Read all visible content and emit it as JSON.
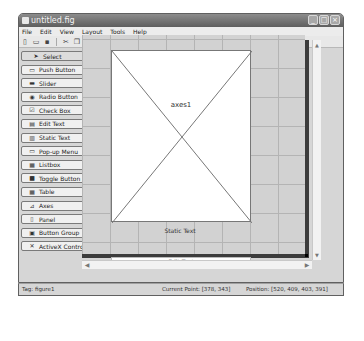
{
  "window": {
    "title": "untitled.fig",
    "controls": [
      "minimize",
      "maximize",
      "close"
    ]
  },
  "menubar": {
    "items": [
      "File",
      "Edit",
      "View",
      "Layout",
      "Tools",
      "Help"
    ]
  },
  "toolbar": {
    "icons": [
      "new-file-icon",
      "open-file-icon",
      "save-icon",
      "cut-icon",
      "copy-icon",
      "paste-icon",
      "undo-icon",
      "redo-icon",
      "align-objects-icon",
      "menu-editor-icon",
      "tab-order-editor-icon",
      "toolbar-editor-icon",
      "m-file-editor-icon",
      "property-inspector-icon",
      "object-browser-icon",
      "run-figure-icon"
    ]
  },
  "palette": {
    "items": [
      {
        "label": "Select",
        "icon": "arrow-pointer-icon"
      },
      {
        "label": "Push Button",
        "icon": "push-button-icon"
      },
      {
        "label": "Slider",
        "icon": "slider-icon"
      },
      {
        "label": "Radio Button",
        "icon": "radio-button-icon"
      },
      {
        "label": "Check Box",
        "icon": "check-box-icon"
      },
      {
        "label": "Edit Text",
        "icon": "edit-text-icon"
      },
      {
        "label": "Static Text",
        "icon": "static-text-icon"
      },
      {
        "label": "Pop-up Menu",
        "icon": "popup-menu-icon"
      },
      {
        "label": "Listbox",
        "icon": "listbox-icon"
      },
      {
        "label": "Toggle Button",
        "icon": "toggle-button-icon"
      },
      {
        "label": "Table",
        "icon": "table-icon"
      },
      {
        "label": "Axes",
        "icon": "axes-icon"
      },
      {
        "label": "Panel",
        "icon": "panel-icon"
      },
      {
        "label": "Button Group",
        "icon": "button-group-icon"
      },
      {
        "label": "ActiveX Control",
        "icon": "activex-icon"
      }
    ]
  },
  "canvas": {
    "axes_label": "axes1",
    "static_text": "Static Text",
    "edit_text": "Edit Text"
  },
  "statusbar": {
    "tag": "Tag: figure1",
    "current_point": "Current Point: [378, 343]",
    "position": "Position: [520, 409, 403, 391]"
  }
}
